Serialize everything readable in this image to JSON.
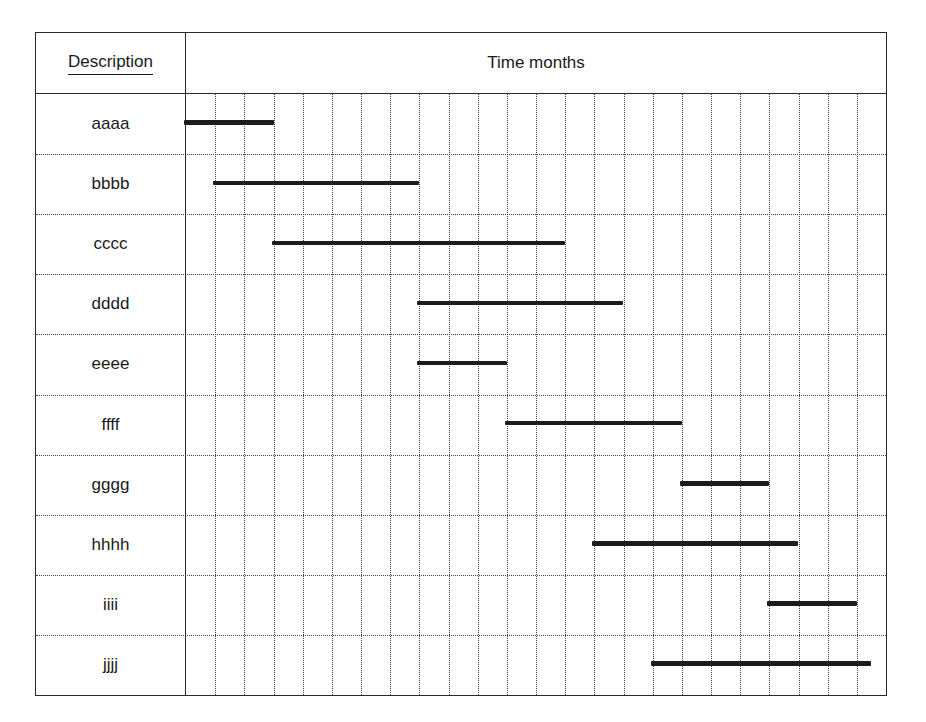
{
  "header": {
    "description_label": "Description",
    "time_label": "Time months"
  },
  "chart_data": {
    "type": "gantt",
    "title": "",
    "xlabel": "Time months",
    "ylabel": "Description",
    "x_range": [
      0,
      24
    ],
    "x_unit": "months",
    "grid": {
      "vertical": "dotted",
      "horizontal": "dotted",
      "columns": 24
    },
    "tasks": [
      {
        "label": "aaaa",
        "start": 0,
        "end": 3
      },
      {
        "label": "bbbb",
        "start": 1,
        "end": 8
      },
      {
        "label": "cccc",
        "start": 3,
        "end": 13
      },
      {
        "label": "dddd",
        "start": 8,
        "end": 15
      },
      {
        "label": "eeee",
        "start": 8,
        "end": 11
      },
      {
        "label": "ffff",
        "start": 11,
        "end": 17
      },
      {
        "label": "gggg",
        "start": 17,
        "end": 20
      },
      {
        "label": "hhhh",
        "start": 14,
        "end": 21
      },
      {
        "label": "iiii",
        "start": 20,
        "end": 23
      },
      {
        "label": "jjjj",
        "start": 16,
        "end": 23.5
      }
    ]
  },
  "colors": {
    "bar": "#1c1c1c",
    "border": "#2a2a2a",
    "grid": "#444444",
    "background": "#ffffff"
  }
}
